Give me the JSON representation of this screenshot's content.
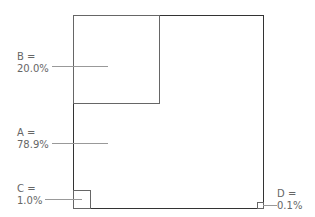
{
  "diagram": {
    "type": "nested-area-squares",
    "items": [
      {
        "id": "A",
        "label_line1": "A =",
        "label_line2": "78.9%",
        "value_pct": 78.9
      },
      {
        "id": "B",
        "label_line1": "B =",
        "label_line2": "20.0%",
        "value_pct": 20.0
      },
      {
        "id": "C",
        "label_line1": "C =",
        "label_line2": "1.0%",
        "value_pct": 1.0
      },
      {
        "id": "D",
        "label_line1": "D =",
        "label_line2": "0.1%",
        "value_pct": 0.1
      }
    ],
    "colors": {
      "outer_border": "#333333",
      "inner_border": "#666666",
      "label_text": "#666666",
      "leader_line": "#999999"
    }
  }
}
